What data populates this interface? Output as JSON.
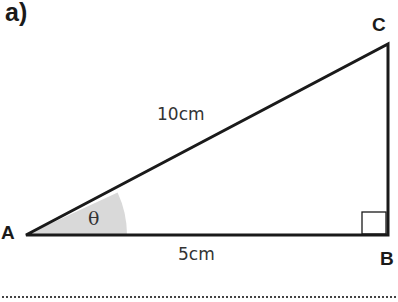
{
  "part_label": "a)",
  "vertices": {
    "A": "A",
    "B": "B",
    "C": "C"
  },
  "sides": {
    "hypotenuse": "10cm",
    "base": "5cm"
  },
  "angle_label": "θ",
  "colors": {
    "stroke": "#1a1a1a",
    "angle_fill": "#d9d9d9"
  }
}
